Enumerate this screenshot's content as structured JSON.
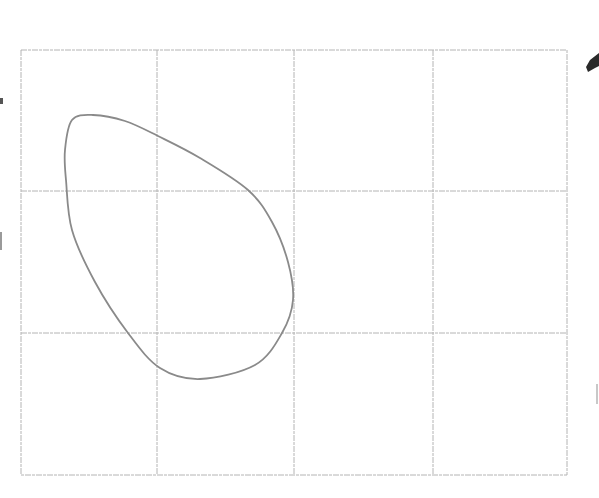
{
  "diagram": {
    "grid": {
      "left": 21,
      "top": 50,
      "right": 567,
      "bottom": 475,
      "vertical_lines": [
        157,
        294,
        433
      ],
      "horizontal_lines": [
        191,
        333
      ],
      "columns": 4,
      "rows": 3,
      "color": "#b4b4b4"
    },
    "curve": {
      "shape": "egg / teardrop closed loop",
      "color": "#8a8a8a",
      "points": [
        [
          72,
          120
        ],
        [
          93,
          115
        ],
        [
          125,
          121
        ],
        [
          158,
          136
        ],
        [
          200,
          158
        ],
        [
          248,
          190
        ],
        [
          272,
          222
        ],
        [
          288,
          262
        ],
        [
          293,
          300
        ],
        [
          282,
          333
        ],
        [
          255,
          365
        ],
        [
          200,
          379
        ],
        [
          160,
          368
        ],
        [
          128,
          333
        ],
        [
          95,
          282
        ],
        [
          72,
          230
        ],
        [
          66,
          180
        ],
        [
          65,
          150
        ]
      ]
    },
    "edge_fragments": {
      "right_arrow_glyph": "arrow-like dark glyph partially cut off",
      "right_mark": "faint gray mark",
      "left_marks": "faint cut-off characters"
    }
  }
}
